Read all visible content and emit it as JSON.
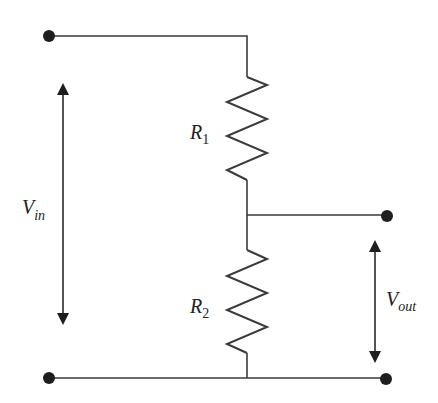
{
  "diagram": {
    "components": {
      "r1": {
        "symbol": "R",
        "subscript": "1"
      },
      "r2": {
        "symbol": "R",
        "subscript": "2"
      }
    },
    "labels": {
      "vin": {
        "symbol": "V",
        "subscript": "in"
      },
      "vout": {
        "symbol": "V",
        "subscript": "out"
      }
    },
    "terminals": [
      "top-left",
      "bottom-left",
      "output-top",
      "output-bottom"
    ],
    "colors": {
      "line": "#3a3a3a",
      "terminal": "#1e1e1e",
      "background": "#ffffff"
    }
  }
}
